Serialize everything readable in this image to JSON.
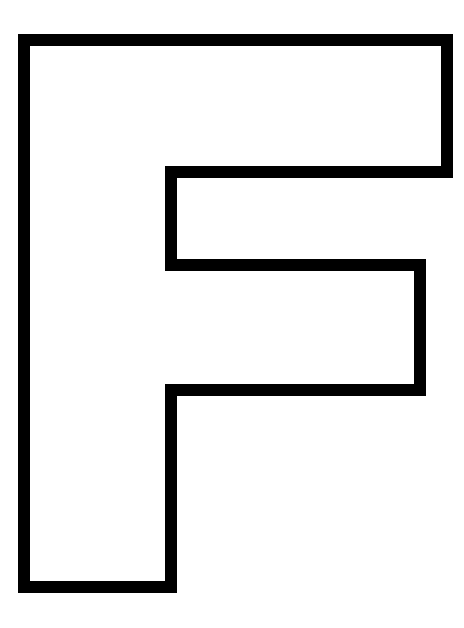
{
  "image": {
    "subject": "Outline of the capital letter F",
    "letter": "F",
    "background_color": "#ffffff",
    "stroke_color": "#000000",
    "fill_color": "#ffffff",
    "stroke_width": 12
  },
  "shape": {
    "outline_points": [
      [
        24,
        40
      ],
      [
        447,
        40
      ],
      [
        447,
        172
      ],
      [
        171,
        172
      ],
      [
        171,
        265
      ],
      [
        420,
        265
      ],
      [
        420,
        390
      ],
      [
        171,
        390
      ],
      [
        171,
        587
      ],
      [
        24,
        587
      ]
    ]
  }
}
